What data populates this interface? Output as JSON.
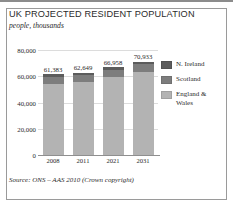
{
  "figure": {
    "title": "UK PROJECTED RESIDENT POPULATION",
    "subtitle": "people, thousands",
    "source": "Source: ONS – AAS 2010 (Crown copyright)"
  },
  "colors": {
    "n_ireland": "#5c5c5c",
    "scotland": "#7d7d7d",
    "england_wales": "#b3b3b3",
    "gridline": "#dcdcdc",
    "axis": "#8f8f8f",
    "frame": "#9a9a9a",
    "text": "#2b2b2b"
  },
  "legend": {
    "position": "right",
    "items": [
      {
        "label": "N. Ireland",
        "color": "#5c5c5c"
      },
      {
        "label": "Scotland",
        "color": "#7d7d7d"
      },
      {
        "label": "England & Wales",
        "color": "#b3b3b3"
      }
    ]
  },
  "chart_data": {
    "type": "bar",
    "stacked": true,
    "title": "UK PROJECTED RESIDENT POPULATION",
    "subtitle": "people, thousands",
    "xlabel": "",
    "ylabel": "people, thousands",
    "ylim": [
      0,
      80000
    ],
    "yticks": [
      0,
      20000,
      40000,
      60000,
      80000
    ],
    "ytick_labels": [
      "0",
      "20,000",
      "40,000",
      "60,000",
      "80,000"
    ],
    "grid": true,
    "categories": [
      "2008",
      "2011",
      "2021",
      "2031"
    ],
    "totals": [
      61383,
      62649,
      66958,
      70933
    ],
    "total_labels": [
      "61,383",
      "62,649",
      "66,958",
      "70,933"
    ],
    "series": [
      {
        "name": "England & Wales",
        "color": "#b3b3b3",
        "values": [
          54454,
          55640,
          59710,
          63480
        ]
      },
      {
        "name": "Scotland",
        "color": "#7d7d7d",
        "values": [
          5170,
          5230,
          5420,
          5620
        ]
      },
      {
        "name": "N. Ireland",
        "color": "#5c5c5c",
        "values": [
          1759,
          1779,
          1828,
          1833
        ]
      }
    ]
  }
}
